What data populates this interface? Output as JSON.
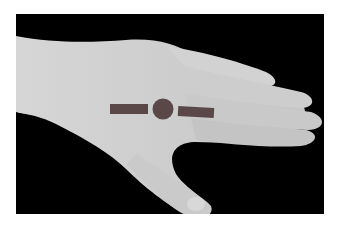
{
  "image": {
    "description": "Grayscale photo of the back of a left hand on a black background, with a marker overlay of two bars and a circle across the knuckles",
    "background_color": "#000000",
    "skin_color": "#cfcfcf",
    "marker_color": "#5a4848"
  }
}
